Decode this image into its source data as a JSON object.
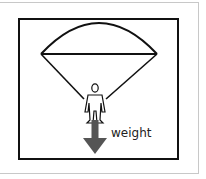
{
  "diagram": {
    "labels": {
      "weight": "weight"
    },
    "colors": {
      "line": "#111111",
      "arrow": "#555555",
      "frame": "#c8c8c8"
    }
  }
}
